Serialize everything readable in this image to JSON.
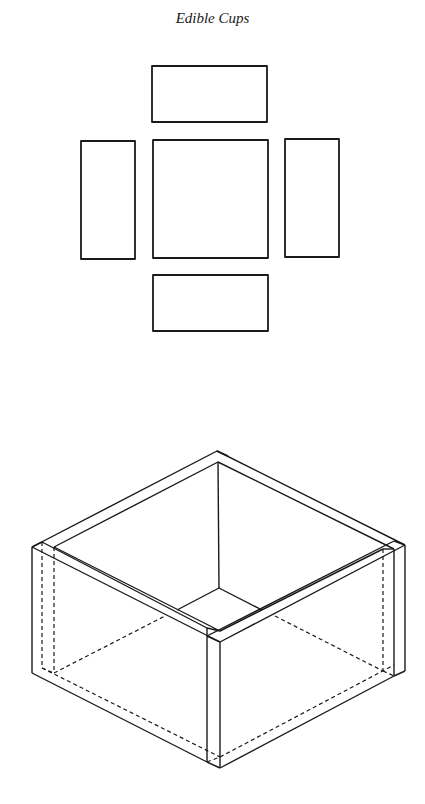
{
  "title": "Edible Cups",
  "colors": {
    "stroke": "#1a1a1a",
    "background": "#ffffff"
  },
  "net": {
    "pieces": [
      {
        "name": "top-flap",
        "x": 152,
        "y": 66,
        "w": 115,
        "h": 56
      },
      {
        "name": "left-flap",
        "x": 81,
        "y": 141,
        "w": 54,
        "h": 118
      },
      {
        "name": "base",
        "x": 153,
        "y": 140,
        "w": 115,
        "h": 118
      },
      {
        "name": "right-flap",
        "x": 285,
        "y": 139,
        "w": 54,
        "h": 118
      },
      {
        "name": "bottom-flap",
        "x": 153,
        "y": 275,
        "w": 115,
        "h": 56
      }
    ]
  },
  "box": {
    "description": "Isometric assembled open box with wall thickness shown; dashed lines indicate hidden edges"
  }
}
